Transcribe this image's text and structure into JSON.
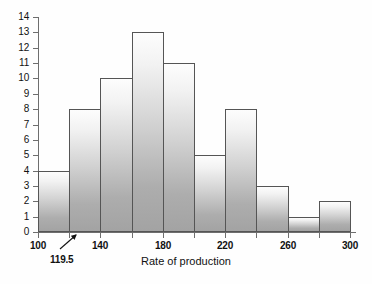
{
  "chart_data": {
    "type": "bar",
    "title": "",
    "subtitle": "",
    "xlabel": "Rate of production",
    "ylabel": "",
    "xlim": [
      100,
      300
    ],
    "ylim": [
      0,
      14
    ],
    "grid": false,
    "legend": "none",
    "bin_width": 20,
    "bin_edges": [
      100,
      120,
      140,
      160,
      180,
      200,
      220,
      240,
      260,
      280,
      300
    ],
    "categories": [
      "100-120",
      "120-140",
      "140-160",
      "160-180",
      "180-200",
      "200-220",
      "220-240",
      "240-260",
      "260-280",
      "280-300"
    ],
    "values": [
      4,
      8,
      10,
      13,
      11,
      5,
      8,
      3,
      1,
      2
    ],
    "x_tick_values": [
      100,
      120,
      140,
      160,
      180,
      200,
      220,
      240,
      260,
      280,
      300
    ],
    "x_tick_labels": [
      "100",
      "",
      "140",
      "",
      "180",
      "",
      "220",
      "",
      "260",
      "",
      "300"
    ],
    "y_tick_values": [
      0,
      1,
      2,
      3,
      4,
      5,
      6,
      7,
      8,
      9,
      10,
      11,
      12,
      13,
      14
    ],
    "y_tick_labels": [
      "0",
      "1",
      "2",
      "3",
      "4",
      "5",
      "6",
      "7",
      "8",
      "9",
      "10",
      "11",
      "12",
      "13",
      "14"
    ],
    "annotations": [
      {
        "name": "lower-boundary-callout",
        "text": "119.5",
        "points_to_x": 120,
        "points_to_y": 0
      }
    ],
    "colors": {
      "bar_fill_top": "#fdfdfd",
      "bar_fill_bottom": "#a3a3a3",
      "bar_stroke": "#555555",
      "axis": "#6e6e6e",
      "text": "#111111",
      "background": "#fefefe"
    }
  }
}
